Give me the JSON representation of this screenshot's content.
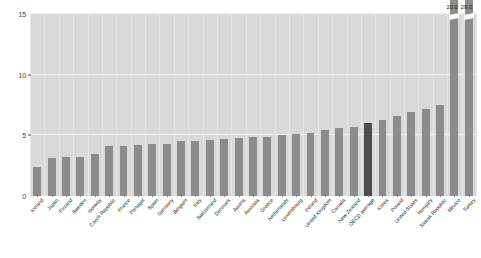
{
  "chart_data": {
    "type": "bar",
    "title": "",
    "subtitle": "",
    "xlabel": "",
    "ylabel": "",
    "ylim": [
      0,
      15
    ],
    "yticks": [
      0,
      5,
      10,
      15
    ],
    "ytick_labels": [
      "0",
      "5",
      "10",
      "15"
    ],
    "grid": true,
    "legend": "none",
    "axis_break": true,
    "axis_break_note": "Two tallest bars are truncated at the top of the axis and carry data labels",
    "highlight_category": "OECD average",
    "categories": [
      "Iceland",
      "Japan",
      "Finland",
      "Sweden",
      "Norway",
      "Czech Republic",
      "France",
      "Portugal",
      "Spain",
      "Germany",
      "Belgium",
      "Italy",
      "Switzerland",
      "Denmark",
      "Austria",
      "Australia",
      "Greece",
      "Netherlands",
      "Luxembourg",
      "Ireland",
      "United Kingdom",
      "Canada",
      "New Zealand",
      "OECD average",
      "Korea",
      "Poland",
      "United States",
      "Hungary",
      "Slovak Republic",
      "Mexico",
      "Turkey"
    ],
    "values": [
      2.4,
      3.1,
      3.2,
      3.2,
      3.5,
      4.1,
      4.1,
      4.2,
      4.3,
      4.3,
      4.5,
      4.5,
      4.6,
      4.7,
      4.8,
      4.9,
      4.9,
      5.0,
      5.1,
      5.2,
      5.4,
      5.6,
      5.7,
      6.0,
      6.3,
      6.6,
      6.9,
      7.2,
      7.5,
      20.0,
      29.0
    ],
    "value_labels": {
      "Mexico": "20.0",
      "Turkey": "29.0"
    },
    "colors": {
      "bar": "#8c8c8c",
      "bar_highlight": "#4d4d4d",
      "plot_background": "#d9d9d9",
      "gridline": "#f2f2f2",
      "page_background": "#ffffff",
      "tick_label": "#3d3d3d",
      "category_label": "#262626"
    }
  }
}
